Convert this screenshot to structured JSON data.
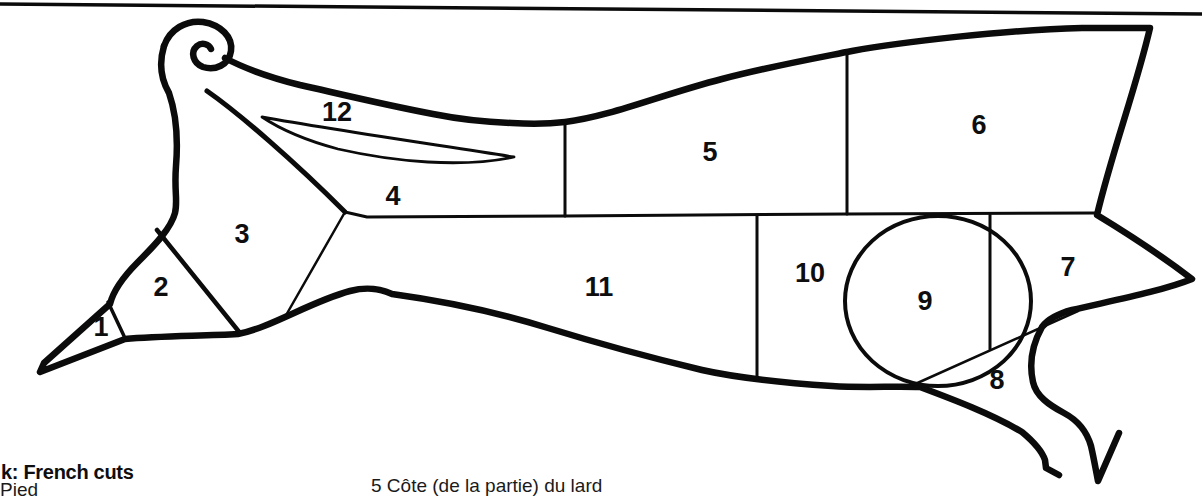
{
  "page": {
    "caption_title": "k: French cuts",
    "caption_clipped_left": "Pied",
    "caption_clipped_middle": "5 Côte (de la partie) du lard"
  },
  "diagram": {
    "kind": "pork-butchery-cuts",
    "regions": [
      {
        "number": "1"
      },
      {
        "number": "2"
      },
      {
        "number": "3"
      },
      {
        "number": "4"
      },
      {
        "number": "5"
      },
      {
        "number": "6"
      },
      {
        "number": "7"
      },
      {
        "number": "8"
      },
      {
        "number": "9"
      },
      {
        "number": "10"
      },
      {
        "number": "11"
      },
      {
        "number": "12"
      }
    ]
  },
  "colors": {
    "ink": "#0b0b0b",
    "background": "#ffffff"
  }
}
